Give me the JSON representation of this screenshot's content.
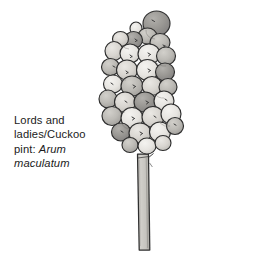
{
  "figure": {
    "type": "botanical-illustration",
    "medium": "grayscale pencil and wash drawing",
    "background_color": "#ffffff"
  },
  "caption": {
    "common_name_line_1": "Lords and",
    "common_name_line_2": "ladies/Cuckoo",
    "common_name_line_3_prefix": "pint: ",
    "scientific_name_part_1": "Arum",
    "scientific_name_part_2": "maculatum",
    "full_text": "Lords and ladies/Cuckoo pint: Arum maculatum",
    "text_color": "#1b1b1b"
  },
  "palette": {
    "outline": "#2e2e2e",
    "berry_light": "#eceae6",
    "berry_pale": "#dedbd6",
    "berry_mid": "#bcbab5",
    "berry_dark": "#9a9894",
    "berry_darkest": "#848281",
    "stem_fill": "#c9c7c2",
    "stem_shadow": "#a9a7a2",
    "speck": "#3a3a3a"
  },
  "illustration_parts": [
    {
      "name": "berry-cluster",
      "description": "dense ovoid head of ~30 overlapping rounded berries"
    },
    {
      "name": "stalk",
      "description": "narrow vertical tapering stem below the cluster"
    }
  ]
}
